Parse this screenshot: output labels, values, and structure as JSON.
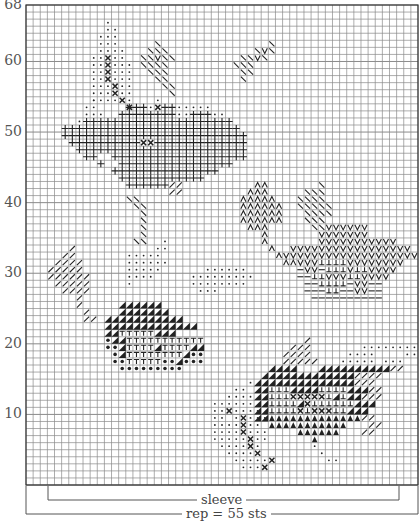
{
  "chart": {
    "columns": 55,
    "rows": 68,
    "y_axis_labels": [
      "68",
      "60",
      "50",
      "40",
      "30",
      "20",
      "10"
    ],
    "y_axis_values": [
      68,
      60,
      50,
      40,
      30,
      20,
      10
    ],
    "grid_color": "#8a8a8a",
    "border_color": "#333333",
    "symbol_color": "#222222"
  },
  "brackets": {
    "sleeve_label": "sleeve",
    "rep_label": "rep = 55 sts"
  },
  "legend_symbols": {
    ".": "dot",
    "x": "cross",
    "+": "plus",
    "/": "slash",
    "\\": "backslash",
    "V": "v-stitch",
    "A": "inverted-v",
    "T": "t-stitch",
    "t": "up-tack",
    "-": "dash",
    "#": "half-filled-triangle",
    "^": "filled-triangle",
    "o": "bullet"
  },
  "motifs": [
    {
      "name": "top-left-stem-dots",
      "col": 7,
      "top": 66,
      "rows": [
        "    .",
        "    ..",
        "   ...",
        "   ...",
        "   ....",
        "  ..x..",
        "  ..x...",
        "  ..x...",
        "  ..x...",
        "  ...x..",
        "  ...x..",
        "  ....x.",
        "       x"
      ]
    },
    {
      "name": "top-leaves",
      "col": 16,
      "top": 63,
      "rows": [
        "  \\               \\",
        " \\\\\\            \\V\\",
        "\\\\V\\\\         \\\\V\\",
        "\\\\\\\\         \\\\\\",
        " \\\\\\          \\\\",
        "  \\\\          \\",
        "   \\\\",
        "    \\"
      ]
    },
    {
      "name": "top-cluster-plus",
      "col": 3,
      "top": 55,
      "rows": [
        "      .        .      ",
        "     ..    +++.x++.....",
        "     ...  ++++++++..+++..",
        "    .+++++++++++++++++++++",
        "  +++++++++++++++++++++++++",
        "  ++++++++++++++++++++++++++",
        "   ++++++++++xx+++++++++++++",
        "    ++++++++++++++++++++++++",
        "     ++  +++++++++++++++++++",
        "       +  ++++++++++++++++",
        "         +++++++++++++++",
        "          ++++++++++++",
        "           ++++++//",
        "                 //"
      ]
    },
    {
      "name": "stem-slash",
      "col": 14,
      "top": 41,
      "rows": [
        "\\\\",
        " \\\\",
        "  \\",
        "  \\",
        "  \\",
        "  \\",
        " \\\\"
      ]
    },
    {
      "name": "middle-right-flowers",
      "col": 29,
      "top": 43,
      "rows": [
        "   AA       \\",
        "  AAA     \\\\\\",
        " AAAAA   \\\\\\\\",
        " AAAAAA  \\\\\\\\\\",
        " AAAAAA   \\\\\\\\",
        " AAAAAA   \\\\\\",
        "  AAA      \\\\VVVVVV",
        "    A       VVVVVVV",
        "    A       VVVVVVVVVVV",
        "     A  VVVVVVVVVVVVVVVVV",
        "      AVVVVVVVVVVVVVVVVVVV",
        "       AAVVVttttVVVVVVVV",
        "         -VV-tttVttVVVV",
        "         --ttVVVttVVVV",
        "          --tttt-VV--",
        "          ---tt--VV--",
        "           ----------"
      ]
    },
    {
      "name": "left-small-leaf",
      "col": 3,
      "top": 34,
      "rows": [
        "   /",
        "  //",
        " ////",
        "/////",
        "//////",
        " /////",
        "  ////",
        "    /",
        "    /",
        "     /",
        "     //"
      ]
    },
    {
      "name": "middle-left-dots",
      "col": 11,
      "top": 35,
      "rows": [
        "        .",
        "       ..",
        "   .....",
        "   ......",
        "   .....",
        "   ....",
        "   ."
      ]
    },
    {
      "name": "middle-right-dots",
      "col": 21,
      "top": 31,
      "rows": [
        "    ......",
        "  .........",
        "  ........",
        "   ..."
      ]
    },
    {
      "name": "middle-left-cluster",
      "col": 9,
      "top": 26,
      "rows": [
        "    ######",
        "    #######",
        "  ###########",
        "  #############",
        "  ##TTTTT###",
        "  o##TTTTTTTTTTT",
        "  oo#TTTT#TTTT##",
        "   o#TTTTTTTT#oo",
        "   ooTTTTToo#ooo",
        "    ooooooooo"
      ]
    },
    {
      "name": "bottom-right-leaves",
      "col": 31,
      "top": 21,
      "rows": [
        "        /",
        "      ///       .........",
        "     ////     ....    ....",
        "     /////   ..... ...",
        "   ####   ##########//",
        "  #############////",
        " ##############///",
        " ##ttt####tttt###//",
        " ##tttxxxxxt#t##///",
        " ##tttt#xtttttt###",
        " ##ttttxtxxxtt###",
        " ##^^^^^^^^^^^^^//",
        "   ^^^^^^^^^^^   //",
        "       ^^^^^^   //",
        "         ^",
        "         .",
        "          .",
        "           .."
      ]
    },
    {
      "name": "bottom-left-stem-dots",
      "col": 26,
      "top": 15,
      "rows": [
        "     .",
        "   ..",
        "  ....",
        "......",
        "..x....",
        ".. .x...",
        "....x..",
        "....x...",
        ".....x..",
        " ....x.",
        "  ....x",
        "   .....x",
        "    ...x"
      ]
    }
  ]
}
